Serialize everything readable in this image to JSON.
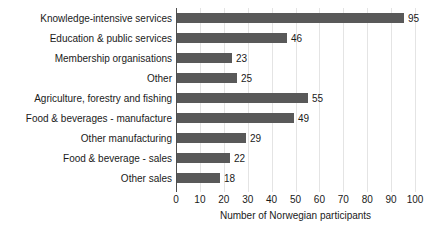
{
  "chart_data": {
    "type": "bar",
    "orientation": "horizontal",
    "title": "",
    "xlabel": "Number of Norwegian participants",
    "ylabel": "",
    "xlim": [
      0,
      100
    ],
    "xticks": [
      0,
      10,
      20,
      30,
      40,
      50,
      60,
      70,
      80,
      90,
      100
    ],
    "grid": true,
    "grid_axis": "x",
    "legend": false,
    "data_labels": true,
    "categories": [
      "Knowledge-intensive services",
      "Education & public services",
      "Membership organisations",
      "Other",
      "Agriculture, forestry and fishing",
      "Food & beverages - manufacture",
      "Other manufacturing",
      "Food & beverage - sales",
      "Other sales"
    ],
    "values": [
      95,
      46,
      23,
      25,
      55,
      49,
      29,
      22,
      18
    ],
    "colors": {
      "bar": "#595959",
      "gridline": "#e4e4e4",
      "axis": "#4d4d4d",
      "text": "#1a1a1a",
      "background": "#ffffff"
    }
  }
}
